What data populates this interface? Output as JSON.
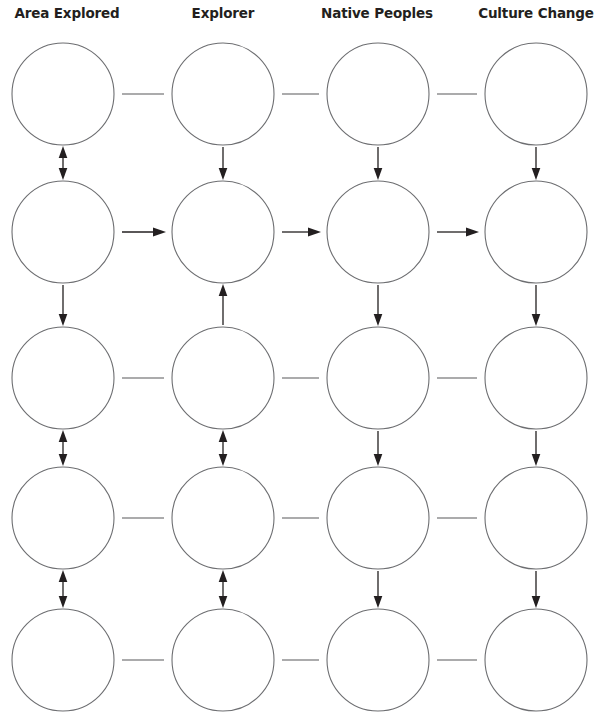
{
  "page": {
    "width": 601,
    "height": 725,
    "background": "#ffffff",
    "type": "graphic-organizer-worksheet"
  },
  "headers": [
    {
      "label": "Area Explored",
      "center_x": 67,
      "column": 1
    },
    {
      "label": "Explorer",
      "center_x": 223,
      "column": 2
    },
    {
      "label": "Native Peoples",
      "center_x": 377,
      "column": 3
    },
    {
      "label": "Culture Change",
      "center_x": 536,
      "column": 4
    }
  ],
  "grid": {
    "columns": 4,
    "rows": 5,
    "circle_radius": 51,
    "circle_diameter": 103,
    "column_centers_x": [
      63,
      223,
      378,
      536
    ],
    "row_centers_y": [
      94,
      232,
      378,
      518,
      660
    ]
  },
  "style": {
    "circle_fill": "#ffffff",
    "circle_stroke": "#6d6e71",
    "line_stroke": "#58595b",
    "arrow_color": "#231f20",
    "header_color": "#231f20"
  },
  "nodes": [
    {
      "id": "r1c1",
      "row": 1,
      "col": 1,
      "label": ""
    },
    {
      "id": "r1c2",
      "row": 1,
      "col": 2,
      "label": ""
    },
    {
      "id": "r1c3",
      "row": 1,
      "col": 3,
      "label": ""
    },
    {
      "id": "r1c4",
      "row": 1,
      "col": 4,
      "label": ""
    },
    {
      "id": "r2c1",
      "row": 2,
      "col": 1,
      "label": ""
    },
    {
      "id": "r2c2",
      "row": 2,
      "col": 2,
      "label": ""
    },
    {
      "id": "r2c3",
      "row": 2,
      "col": 3,
      "label": ""
    },
    {
      "id": "r2c4",
      "row": 2,
      "col": 4,
      "label": ""
    },
    {
      "id": "r3c1",
      "row": 3,
      "col": 1,
      "label": ""
    },
    {
      "id": "r3c2",
      "row": 3,
      "col": 2,
      "label": ""
    },
    {
      "id": "r3c3",
      "row": 3,
      "col": 3,
      "label": ""
    },
    {
      "id": "r3c4",
      "row": 3,
      "col": 4,
      "label": ""
    },
    {
      "id": "r4c1",
      "row": 4,
      "col": 1,
      "label": ""
    },
    {
      "id": "r4c2",
      "row": 4,
      "col": 2,
      "label": ""
    },
    {
      "id": "r4c3",
      "row": 4,
      "col": 3,
      "label": ""
    },
    {
      "id": "r4c4",
      "row": 4,
      "col": 4,
      "label": ""
    },
    {
      "id": "r5c1",
      "row": 5,
      "col": 1,
      "label": ""
    },
    {
      "id": "r5c2",
      "row": 5,
      "col": 2,
      "label": ""
    },
    {
      "id": "r5c3",
      "row": 5,
      "col": 3,
      "label": ""
    },
    {
      "id": "r5c4",
      "row": 5,
      "col": 4,
      "label": ""
    }
  ],
  "horizontal_connectors": [
    {
      "row": 1,
      "between": "r1c1-r1c2",
      "kind": "line"
    },
    {
      "row": 1,
      "between": "r1c2-r1c3",
      "kind": "line"
    },
    {
      "row": 1,
      "between": "r1c3-r1c4",
      "kind": "line"
    },
    {
      "row": 2,
      "between": "r2c1-r2c2",
      "kind": "arrow-right"
    },
    {
      "row": 2,
      "between": "r2c2-r2c3",
      "kind": "arrow-right"
    },
    {
      "row": 2,
      "between": "r2c3-r2c4",
      "kind": "arrow-right"
    },
    {
      "row": 3,
      "between": "r3c1-r3c2",
      "kind": "line"
    },
    {
      "row": 3,
      "between": "r3c2-r3c3",
      "kind": "line"
    },
    {
      "row": 3,
      "between": "r3c3-r3c4",
      "kind": "line"
    },
    {
      "row": 4,
      "between": "r4c1-r4c2",
      "kind": "line"
    },
    {
      "row": 4,
      "between": "r4c2-r4c3",
      "kind": "line"
    },
    {
      "row": 4,
      "between": "r4c3-r4c4",
      "kind": "line"
    },
    {
      "row": 5,
      "between": "r5c1-r5c2",
      "kind": "line"
    },
    {
      "row": 5,
      "between": "r5c2-r5c3",
      "kind": "line"
    },
    {
      "row": 5,
      "between": "r5c3-r5c4",
      "kind": "line"
    }
  ],
  "vertical_connectors": [
    {
      "col": 1,
      "between": "r1c1-r2c1",
      "kind": "arrow-both"
    },
    {
      "col": 1,
      "between": "r2c1-r3c1",
      "kind": "arrow-down"
    },
    {
      "col": 1,
      "between": "r3c1-r4c1",
      "kind": "arrow-both"
    },
    {
      "col": 1,
      "between": "r4c1-r5c1",
      "kind": "arrow-both"
    },
    {
      "col": 2,
      "between": "r1c2-r2c2",
      "kind": "arrow-down"
    },
    {
      "col": 2,
      "between": "r2c2-r3c2",
      "kind": "arrow-up"
    },
    {
      "col": 2,
      "between": "r3c2-r4c2",
      "kind": "arrow-both"
    },
    {
      "col": 2,
      "between": "r4c2-r5c2",
      "kind": "arrow-both"
    },
    {
      "col": 3,
      "between": "r1c3-r2c3",
      "kind": "arrow-down"
    },
    {
      "col": 3,
      "between": "r2c3-r3c3",
      "kind": "arrow-down"
    },
    {
      "col": 3,
      "between": "r3c3-r4c3",
      "kind": "arrow-down"
    },
    {
      "col": 3,
      "between": "r4c3-r5c3",
      "kind": "arrow-down"
    },
    {
      "col": 4,
      "between": "r1c4-r2c4",
      "kind": "arrow-down"
    },
    {
      "col": 4,
      "between": "r2c4-r3c4",
      "kind": "arrow-down"
    },
    {
      "col": 4,
      "between": "r3c4-r4c4",
      "kind": "arrow-down"
    },
    {
      "col": 4,
      "between": "r4c4-r5c4",
      "kind": "arrow-down"
    }
  ]
}
